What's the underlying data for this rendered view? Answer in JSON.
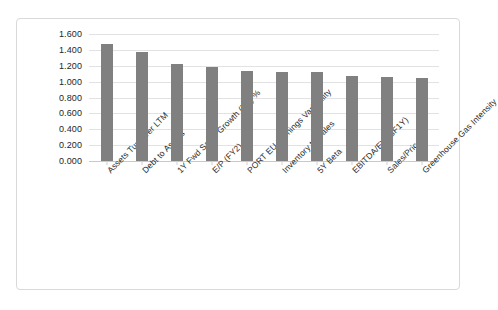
{
  "chart_data": {
    "type": "bar",
    "title": "",
    "xlabel": "",
    "ylabel": "",
    "ylim": [
      0.0,
      1.6
    ],
    "ytick_labels": [
      "1.600",
      "1.400",
      "1.200",
      "1.000",
      "0.800",
      "0.600",
      "0.400",
      "0.200",
      "0.000"
    ],
    "ytick_values": [
      1.6,
      1.4,
      1.2,
      1.0,
      0.8,
      0.6,
      0.4,
      0.2,
      0.0
    ],
    "grid": true,
    "legend": "none",
    "bar_color": "#808080",
    "categories": [
      "Assets Turnover LTM",
      "Debt to Assets",
      "1Y Fwd Sales Growth (BF) %",
      "E/P (FY2)",
      "PORT EU Earnings Variability",
      "Inventory to Sales",
      "5Y Beta",
      "EBITDA/EV (BF1Y)",
      "Sales/Price",
      "Greenhouse Gas Intensity"
    ],
    "values": [
      1.48,
      1.37,
      1.225,
      1.19,
      1.14,
      1.125,
      1.12,
      1.075,
      1.06,
      1.045
    ]
  }
}
